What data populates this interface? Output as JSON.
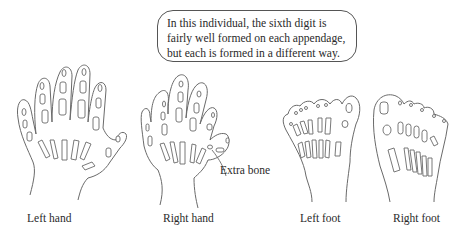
{
  "callout": {
    "lines": [
      "In this individual, the sixth digit is",
      "fairly well formed on each appendage,",
      "but each is formed in a different way."
    ]
  },
  "annotations": {
    "extra_bone": "Extra bone"
  },
  "panels": [
    {
      "id": "left-hand",
      "label": "Left hand"
    },
    {
      "id": "right-hand",
      "label": "Right hand"
    },
    {
      "id": "left-foot",
      "label": "Left foot"
    },
    {
      "id": "right-foot",
      "label": "Right foot"
    }
  ]
}
